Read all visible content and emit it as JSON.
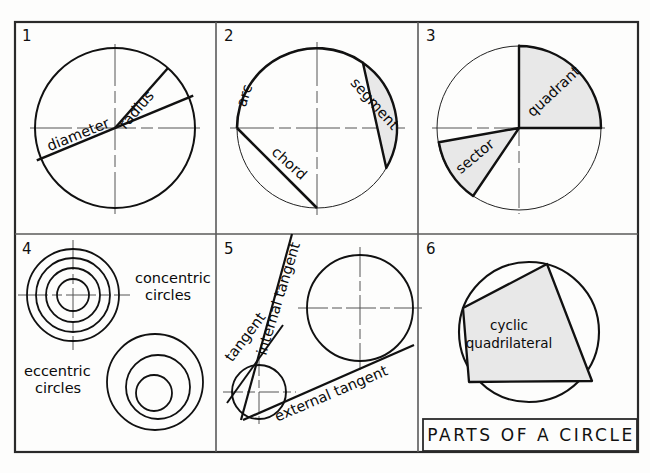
{
  "drawing": {
    "title": "PARTS OF A CIRCLE",
    "background": "#fdfdfc",
    "ink": "#111111",
    "shade": "#e8e8e8"
  },
  "panels": [
    {
      "number": "1",
      "labels": {
        "radius": "radius",
        "diameter": "diameter",
        "circumference": "circumference"
      }
    },
    {
      "number": "2",
      "labels": {
        "arc": "arc",
        "segment": "segment",
        "chord": "chord"
      }
    },
    {
      "number": "3",
      "labels": {
        "quadrant": "quadrant",
        "sector": "sector"
      }
    },
    {
      "number": "4",
      "labels": {
        "concentric_line1": "concentric",
        "concentric_line2": "circles",
        "eccentric_line1": "eccentric",
        "eccentric_line2": "circles"
      }
    },
    {
      "number": "5",
      "labels": {
        "tangent": "tangent",
        "internal_tangent": "internal tangent",
        "external_tangent": "external tangent"
      }
    },
    {
      "number": "6",
      "labels": {
        "cyclic_line1": "cyclic",
        "cyclic_line2": "quadrilateral"
      }
    }
  ]
}
